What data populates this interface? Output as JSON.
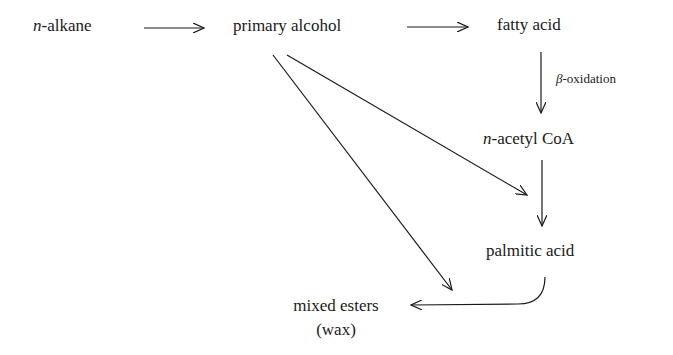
{
  "diagram": {
    "type": "flowchart",
    "title": "",
    "nodes": {
      "n_alkane": {
        "prefix": "n",
        "text": "-alkane"
      },
      "primary_alcohol": {
        "text": "primary alcohol"
      },
      "fatty_acid": {
        "text": "fatty acid"
      },
      "n_acetyl_coa": {
        "prefix": "n",
        "text": "-acetyl CoA"
      },
      "palmitic_acid": {
        "text": "palmitic acid"
      },
      "mixed_esters": {
        "line1": "mixed esters",
        "line2": "(wax)"
      }
    },
    "edge_labels": {
      "beta_oxidation": {
        "prefix": "β",
        "text": "-oxidation"
      }
    },
    "edges": [
      {
        "from": "n-alkane",
        "to": "primary alcohol"
      },
      {
        "from": "primary alcohol",
        "to": "fatty acid"
      },
      {
        "from": "fatty acid",
        "to": "n-acetyl CoA",
        "label": "β-oxidation"
      },
      {
        "from": "n-acetyl CoA",
        "to": "palmitic acid"
      },
      {
        "from": "primary alcohol",
        "to": "palmitic acid"
      },
      {
        "from": "primary alcohol",
        "to": "mixed esters (wax)"
      },
      {
        "from": "palmitic acid",
        "to": "mixed esters (wax)"
      }
    ],
    "colors": {
      "line": "#1a1a1a",
      "background": "#ffffff"
    }
  }
}
